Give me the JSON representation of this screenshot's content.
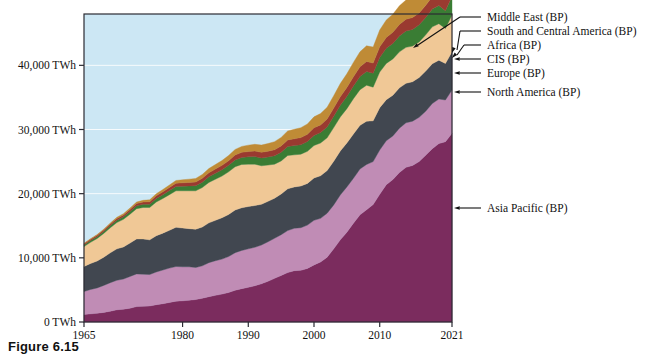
{
  "figure": {
    "caption": "Figure 6.15"
  },
  "chart_data": {
    "type": "area",
    "stacked": true,
    "title": "",
    "xlabel": "",
    "ylabel": "",
    "grid": true,
    "legend_position": "right-annotations",
    "plot_background": "#cce7f4",
    "xlim": [
      1965,
      2021
    ],
    "ylim": [
      0,
      48000
    ],
    "yticks": [
      0,
      10000,
      20000,
      30000,
      40000
    ],
    "ytick_labels": [
      "0 TWh",
      "10,000 TWh",
      "20,000 TWh",
      "30,000 TWh",
      "40,000 TWh"
    ],
    "xticks": [
      1965,
      1980,
      1990,
      2000,
      2010,
      2021
    ],
    "xtick_labels": [
      "1965",
      "1980",
      "1990",
      "2000",
      "2010",
      "2021"
    ],
    "x": [
      1965,
      1966,
      1967,
      1968,
      1969,
      1970,
      1971,
      1972,
      1973,
      1974,
      1975,
      1976,
      1977,
      1978,
      1979,
      1980,
      1981,
      1982,
      1983,
      1984,
      1985,
      1986,
      1987,
      1988,
      1989,
      1990,
      1991,
      1992,
      1993,
      1994,
      1995,
      1996,
      1997,
      1998,
      1999,
      2000,
      2001,
      2002,
      2003,
      2004,
      2005,
      2006,
      2007,
      2008,
      2009,
      2010,
      2011,
      2012,
      2013,
      2014,
      2015,
      2016,
      2017,
      2018,
      2019,
      2020,
      2021
    ],
    "series": [
      {
        "name": "Asia Pacific (BP)",
        "color": "#7b2c5e",
        "values": [
          1150,
          1270,
          1360,
          1500,
          1680,
          1900,
          2000,
          2150,
          2400,
          2450,
          2500,
          2700,
          2850,
          3050,
          3250,
          3300,
          3400,
          3500,
          3700,
          3950,
          4150,
          4350,
          4600,
          4950,
          5200,
          5400,
          5650,
          5950,
          6350,
          6800,
          7250,
          7700,
          8000,
          8050,
          8350,
          8900,
          9350,
          10100,
          11400,
          12800,
          14000,
          15400,
          16700,
          17500,
          18300,
          19900,
          21400,
          22200,
          23300,
          24100,
          24400,
          25000,
          26000,
          27000,
          27800,
          28100,
          29400
        ]
      },
      {
        "name": "North America (BP)",
        "color": "#c08cb5",
        "values": [
          3600,
          3800,
          3950,
          4200,
          4450,
          4600,
          4700,
          4950,
          5100,
          5000,
          4900,
          5100,
          5250,
          5350,
          5400,
          5300,
          5200,
          5000,
          5050,
          5300,
          5400,
          5450,
          5600,
          5850,
          5950,
          6000,
          6000,
          6050,
          6150,
          6250,
          6350,
          6550,
          6600,
          6650,
          6750,
          6950,
          6800,
          6850,
          6850,
          7000,
          7050,
          7000,
          7150,
          7050,
          6700,
          6900,
          6850,
          6800,
          6900,
          6950,
          6900,
          6900,
          6850,
          7050,
          6950,
          6500,
          6750
        ]
      },
      {
        "name": "Europe (BP)",
        "color": "#414750",
        "values": [
          3900,
          4050,
          4200,
          4400,
          4650,
          4900,
          5000,
          5200,
          5450,
          5500,
          5400,
          5650,
          5750,
          5900,
          6100,
          6050,
          5950,
          5950,
          6050,
          6200,
          6300,
          6450,
          6550,
          6650,
          6650,
          6600,
          6500,
          6350,
          6300,
          6250,
          6350,
          6500,
          6450,
          6500,
          6500,
          6600,
          6650,
          6650,
          6800,
          6850,
          6850,
          6900,
          6800,
          6750,
          6350,
          6600,
          6400,
          6350,
          6300,
          6150,
          6150,
          6200,
          6250,
          6200,
          6050,
          5700,
          5950
        ]
      },
      {
        "name": "CIS (BP)",
        "color": "#f0c896",
        "values": [
          3100,
          3300,
          3500,
          3700,
          3900,
          4100,
          4300,
          4500,
          4700,
          4900,
          5050,
          5250,
          5400,
          5550,
          5700,
          5800,
          5900,
          6000,
          6150,
          6300,
          6400,
          6500,
          6650,
          6750,
          6750,
          6600,
          6450,
          6000,
          5650,
          5300,
          5150,
          5200,
          5000,
          4950,
          5000,
          5050,
          5100,
          5100,
          5250,
          5300,
          5350,
          5500,
          5550,
          5600,
          5250,
          5550,
          5650,
          5650,
          5600,
          5600,
          5550,
          5550,
          5650,
          5750,
          5700,
          5450,
          5750
        ]
      },
      {
        "name": "Africa (BP)",
        "color": "#3a7d34",
        "values": [
          250,
          270,
          290,
          310,
          340,
          370,
          400,
          430,
          460,
          490,
          520,
          560,
          600,
          640,
          680,
          720,
          760,
          800,
          840,
          880,
          930,
          970,
          1010,
          1060,
          1100,
          1140,
          1180,
          1220,
          1260,
          1300,
          1350,
          1400,
          1440,
          1480,
          1520,
          1580,
          1620,
          1680,
          1750,
          1820,
          1900,
          1980,
          2060,
          2140,
          2180,
          2280,
          2350,
          2420,
          2490,
          2560,
          2600,
          2660,
          2720,
          2790,
          2830,
          2760,
          2900
        ]
      },
      {
        "name": "South and Central America (BP)",
        "color": "#9a3a30",
        "values": [
          180,
          195,
          210,
          230,
          250,
          270,
          290,
          315,
          340,
          360,
          380,
          410,
          440,
          470,
          500,
          520,
          545,
          565,
          600,
          630,
          660,
          690,
          720,
          760,
          790,
          820,
          850,
          880,
          910,
          950,
          990,
          1030,
          1070,
          1110,
          1140,
          1190,
          1200,
          1240,
          1290,
          1350,
          1400,
          1450,
          1510,
          1560,
          1570,
          1650,
          1700,
          1740,
          1790,
          1830,
          1840,
          1850,
          1880,
          1920,
          1940,
          1860,
          1960
        ]
      },
      {
        "name": "Middle East (BP)",
        "color": "#bf8b36",
        "values": [
          90,
          100,
          115,
          130,
          150,
          170,
          190,
          215,
          240,
          265,
          290,
          320,
          355,
          390,
          430,
          470,
          510,
          550,
          600,
          650,
          700,
          750,
          810,
          870,
          930,
          1000,
          1060,
          1120,
          1190,
          1260,
          1330,
          1400,
          1470,
          1540,
          1610,
          1700,
          1760,
          1840,
          1930,
          2030,
          2130,
          2230,
          2340,
          2440,
          2500,
          2620,
          2720,
          2810,
          2900,
          2990,
          3050,
          3110,
          3180,
          3250,
          3290,
          3180,
          3300
        ]
      }
    ],
    "annotations": [
      {
        "label": "Middle East (BP)",
        "style": "elbow-arrow"
      },
      {
        "label": "South and Central America (BP)",
        "style": "elbow-arrow"
      },
      {
        "label": "Africa (BP)",
        "style": "elbow-arrow"
      },
      {
        "label": "CIS (BP)",
        "style": "straight-arrow"
      },
      {
        "label": "Europe (BP)",
        "style": "straight-arrow"
      },
      {
        "label": "North America (BP)",
        "style": "straight-arrow"
      },
      {
        "label": "Asia Pacific (BP)",
        "style": "straight-arrow"
      }
    ]
  }
}
